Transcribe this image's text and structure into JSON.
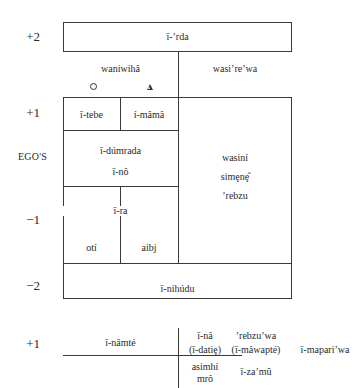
{
  "generations": {
    "plus2": "+2",
    "plus1": "+1",
    "ego": "EGO'S",
    "minus1": "−1",
    "minus2": "−2"
  },
  "upper_diagram": {
    "top_box": "ī-’rda",
    "left_header": "waniwihâ",
    "right_header": "wasi’re’wa",
    "female_symbol": "circle",
    "male_symbol": "triangle",
    "cells": {
      "itebe": "ī-tebe",
      "imama": "í-mâmâ",
      "idumrada": "ī-dúmrada",
      "ino": "ī-nô",
      "ira": "ī-ra",
      "oti": "otí",
      "aibj": "aibj",
      "wasini": "wasiní",
      "simene": "simȩnȩ̂",
      "rebzu": "’rebzu",
      "inihudu": "ī-nihúdu"
    }
  },
  "lower_diagram": {
    "generation": "+1",
    "inamte": "ī-nâmté",
    "ina": "ī-nâ",
    "idatie": "(ī-datiȩ)",
    "rebzuwa": "’rebzu’wa",
    "imawapte": "(ī-mâwapté)",
    "imapariwa": "ī-mapari’wa",
    "asimhi": "asimhí",
    "mro": "mrô",
    "izamu": "ī-za’mû"
  }
}
